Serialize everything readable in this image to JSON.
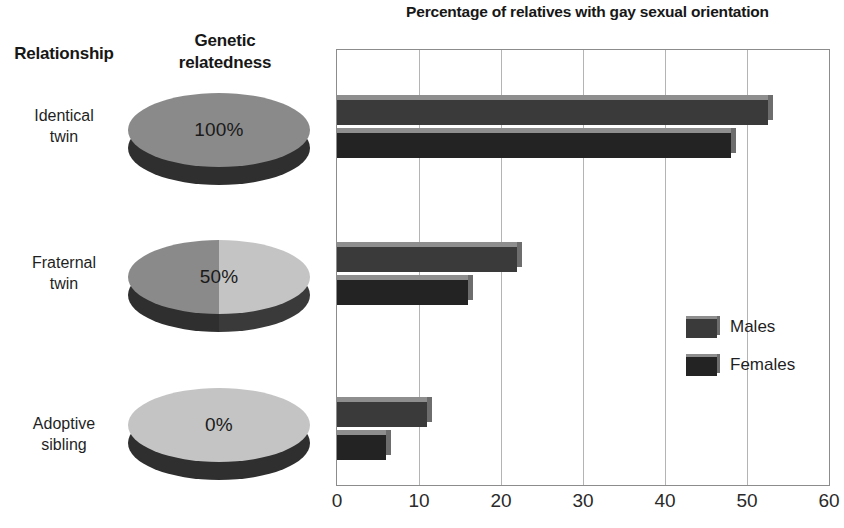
{
  "headers": {
    "relationship": "Relationship",
    "genetic_relatedness": "Genetic\nrelatedness"
  },
  "rows": [
    {
      "label": "Identical\ntwin",
      "genetic_pct": "100%",
      "pie_fraction": 1.0
    },
    {
      "label": "Fraternal\ntwin",
      "genetic_pct": "50%",
      "pie_fraction": 0.5
    },
    {
      "label": "Adoptive\nsibling",
      "genetic_pct": "0%",
      "pie_fraction": 0.0
    }
  ],
  "colors": {
    "pie_dark": "#8a8a8a",
    "pie_light": "#c4c4c4",
    "pie_side_dark": "#2f2f2f",
    "males_bar": "#3a3a3a",
    "females_bar": "#232323",
    "gridline": "#b4b4b4",
    "frame": "#8c8c8c"
  },
  "chart_data": {
    "type": "bar",
    "title": "Percentage of relatives with gay sexual orientation",
    "orientation": "horizontal",
    "xlabel": "",
    "ylabel": "",
    "categories": [
      "Identical twin",
      "Fraternal twin",
      "Adoptive sibling"
    ],
    "series": [
      {
        "name": "Males",
        "values": [
          52.5,
          22.0,
          11.0
        ],
        "color": "#3a3a3a"
      },
      {
        "name": "Females",
        "values": [
          48.0,
          16.0,
          6.0
        ],
        "color": "#232323"
      }
    ],
    "xlim": [
      0,
      60
    ],
    "xticks": [
      0,
      10,
      20,
      30,
      40,
      50,
      60
    ],
    "xtick_labels": [
      "0",
      "10",
      "20",
      "30",
      "40",
      "50",
      "60"
    ],
    "grid": true,
    "grid_axis": "x",
    "legend": [
      "Males",
      "Females"
    ],
    "legend_position": "center-right"
  }
}
